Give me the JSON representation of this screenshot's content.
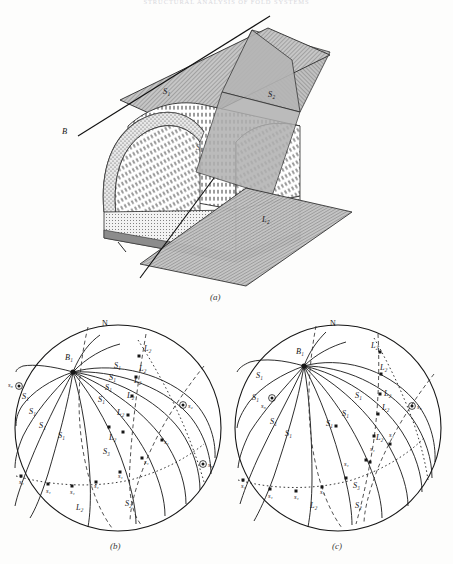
{
  "running_head": "STRUCTURAL ANALYSIS OF FOLD SYSTEMS",
  "figure": {
    "captions": {
      "a": "(a)",
      "b": "(b)",
      "c": "(c)"
    }
  },
  "block_diagram": {
    "labels": {
      "s1_plane": "S₁",
      "s2_plane": "S₂",
      "s1_folded": "S₁",
      "b_axis": "B",
      "l2_lineation": "L₂"
    }
  },
  "stereonet_b": {
    "north_label": "N",
    "b_axis_label": "B₁",
    "s1_labels": [
      "S₁",
      "S₁",
      "S₁",
      "S₁",
      "S₁",
      "S₁",
      "S₁",
      "S₁",
      "S₁",
      "S₁"
    ],
    "l2_labels": [
      "L₂",
      "L₂",
      "L₂",
      "L₂",
      "L₂",
      "L₂",
      "L₂"
    ],
    "s2_label": "S₂",
    "s3_label": "S₃",
    "s1_point_labels": [
      "s₁",
      "s₁",
      "s₁",
      "s₁",
      "s₁",
      "s₁",
      "s₁",
      "s₁"
    ],
    "s2_point_label": "s₂",
    "s3_point_labels": [
      "s₃",
      "s₃"
    ]
  },
  "stereonet_c": {
    "north_label": "N",
    "b_axis_label": "B₁",
    "s1_labels": [
      "S₁",
      "S₁",
      "S₁",
      "S₁",
      "S₁",
      "S₁",
      "S₁",
      "S₁"
    ],
    "l2_labels": [
      "L₂",
      "L₂",
      "L₂",
      "L₂",
      "L₂",
      "L₂"
    ],
    "s2_label": "S₂",
    "s3_label": "S₃",
    "s1_point_labels": [
      "s₁",
      "s₁",
      "s₁",
      "s₁",
      "s₁",
      "s₁",
      "s₁"
    ],
    "s2_point_label": "s₂",
    "s3_point_label": "s₃"
  },
  "colors": {
    "ink": "#161616",
    "plane_fill": "#b9b9b9",
    "plane_fill_light": "#cfcfcf",
    "paper": "#fdfdfc"
  }
}
